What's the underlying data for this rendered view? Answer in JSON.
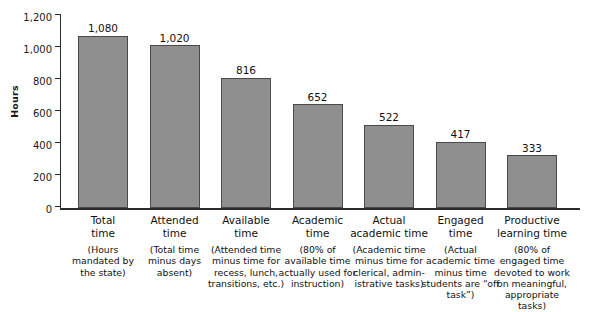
{
  "chart_data": {
    "type": "bar",
    "title": "",
    "xlabel": "",
    "ylabel": "Hours",
    "ylim": [
      0,
      1200
    ],
    "ytick_step": 200,
    "yticks": [
      "0",
      "200",
      "400",
      "600",
      "800",
      "1,000",
      "1,200"
    ],
    "grid": false,
    "legend": null,
    "bar_color": "#8f8f8f",
    "bar_border_color": "#4a4a4a",
    "axis_color": "#2b2b2b",
    "categories": [
      "Total time",
      "Attended time",
      "Available time",
      "Academic time",
      "Actual academic time",
      "Engaged time",
      "Productive learning time"
    ],
    "values": [
      1080,
      1020,
      816,
      652,
      522,
      417,
      333
    ],
    "value_labels": [
      "1,080",
      "1,020",
      "816",
      "652",
      "522",
      "417",
      "333"
    ],
    "bars": [
      {
        "name_line1": "Total",
        "name_line2": "time",
        "description": "(Hours mandated by the state)",
        "value": 1080,
        "value_label": "1,080"
      },
      {
        "name_line1": "Attended",
        "name_line2": "time",
        "description": "(Total time minus days absent)",
        "value": 1020,
        "value_label": "1,020"
      },
      {
        "name_line1": "Available",
        "name_line2": "time",
        "description": "(Attended time minus time for recess, lunch, transitions, etc.)",
        "value": 816,
        "value_label": "816"
      },
      {
        "name_line1": "Academic",
        "name_line2": "time",
        "description": "(80% of available time actually used for instruction)",
        "value": 652,
        "value_label": "652"
      },
      {
        "name_line1": "Actual",
        "name_line2": "academic time",
        "description": "(Academic time minus time for clerical, admin-istrative tasks)",
        "value": 522,
        "value_label": "522"
      },
      {
        "name_line1": "Engaged",
        "name_line2": "time",
        "description": "(Actual academic time minus time students are “off task”)",
        "value": 417,
        "value_label": "417"
      },
      {
        "name_line1": "Productive",
        "name_line2": "learning time",
        "description": "(80% of engaged time devoted to work on meaningful, appropriate tasks)",
        "value": 333,
        "value_label": "333"
      }
    ]
  },
  "axis": {
    "y_title": "Hours",
    "y_tick_1200": "1,200",
    "y_tick_1000": "1,000",
    "y_tick_800": "800",
    "y_tick_600": "600",
    "y_tick_400": "400",
    "y_tick_200": "200",
    "y_tick_0": "0"
  }
}
